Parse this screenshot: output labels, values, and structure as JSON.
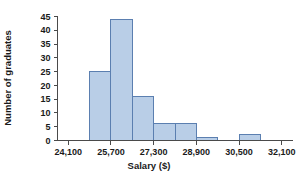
{
  "chart_data": {
    "type": "bar",
    "title": "",
    "xlabel": "Salary ($)",
    "ylabel": "Number of graduates",
    "grid": false,
    "legend": "none",
    "bin_width": 800,
    "xlim": [
      23700,
      32500
    ],
    "ylim": [
      0,
      45
    ],
    "x_ticks": [
      24100,
      25700,
      27300,
      28900,
      30500,
      32100
    ],
    "x_tick_labels": [
      "24,100",
      "25,700",
      "27,300",
      "28,900",
      "30,500",
      "32,100"
    ],
    "y_ticks": [
      0,
      5,
      10,
      15,
      20,
      25,
      30,
      35,
      40,
      45
    ],
    "y_tick_labels": [
      "0",
      "5",
      "10",
      "15",
      "20",
      "25",
      "30",
      "35",
      "40",
      "45"
    ],
    "bins": [
      {
        "start": 24900,
        "end": 25700,
        "value": 25
      },
      {
        "start": 25700,
        "end": 26500,
        "value": 44
      },
      {
        "start": 26500,
        "end": 27300,
        "value": 16
      },
      {
        "start": 27300,
        "end": 28100,
        "value": 6
      },
      {
        "start": 28100,
        "end": 28900,
        "value": 6
      },
      {
        "start": 28900,
        "end": 29700,
        "value": 1
      },
      {
        "start": 30500,
        "end": 31300,
        "value": 2
      }
    ],
    "categories": [
      "24,900-25,700",
      "25,700-26,500",
      "26,500-27,300",
      "27,300-28,100",
      "28,100-28,900",
      "28,900-29,700",
      "30,500-31,300"
    ],
    "values": [
      25,
      44,
      16,
      6,
      6,
      1,
      2
    ],
    "colors": {
      "bar_fill": "#b9cee7",
      "bar_stroke": "#5b7fb0",
      "axis": "#4a4a4a",
      "text": "#1a1a1a",
      "background": "#ffffff"
    }
  }
}
